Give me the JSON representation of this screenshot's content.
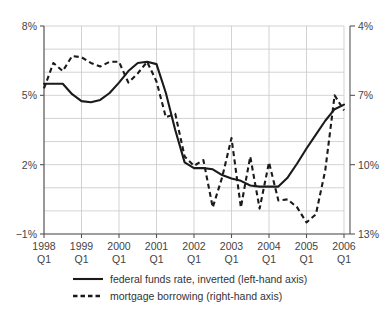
{
  "chart_data": {
    "type": "line",
    "title": "",
    "subtitle": "",
    "xlabel": "",
    "ylabel": "",
    "grid": true,
    "legend_position": "bottom",
    "x_tick_labels": [
      {
        "year": "1998",
        "quarter": "Q1"
      },
      {
        "year": "1999",
        "quarter": "Q1"
      },
      {
        "year": "2000",
        "quarter": "Q1"
      },
      {
        "year": "2001",
        "quarter": "Q1"
      },
      {
        "year": "2002",
        "quarter": "Q1"
      },
      {
        "year": "2003",
        "quarter": "Q1"
      },
      {
        "year": "2004",
        "quarter": "Q1"
      },
      {
        "year": "2005",
        "quarter": "Q1"
      },
      {
        "year": "2006",
        "quarter": "Q1"
      }
    ],
    "left_axis": {
      "name": "federal funds rate, inverted (left-hand axis)",
      "tick_labels": [
        "−1%",
        "2%",
        "5%",
        "8%"
      ],
      "tick_values": [
        -1,
        2,
        5,
        8
      ],
      "ylim": [
        8,
        -1
      ],
      "inverted": true
    },
    "right_axis": {
      "name": "mortgage borrowing (right-hand axis)",
      "tick_labels": [
        "13%",
        "10%",
        "7%",
        "4%"
      ],
      "tick_values": [
        13,
        10,
        7,
        4
      ],
      "ylim": [
        4,
        13
      ],
      "inverted": false
    },
    "x": [
      1998.0,
      1998.25,
      1998.5,
      1998.75,
      1999.0,
      1999.25,
      1999.5,
      1999.75,
      2000.0,
      2000.25,
      2000.5,
      2000.75,
      2001.0,
      2001.25,
      2001.5,
      2001.75,
      2002.0,
      2002.25,
      2002.5,
      2002.75,
      2003.0,
      2003.25,
      2003.5,
      2003.75,
      2004.0,
      2004.25,
      2004.5,
      2004.75,
      2005.0,
      2005.25,
      2005.5,
      2005.75,
      2006.0
    ],
    "series": [
      {
        "name": "federal funds rate, inverted (left-hand axis)",
        "axis": "left",
        "style": "solid",
        "values": [
          5.5,
          5.5,
          5.5,
          5.05,
          4.75,
          4.7,
          4.8,
          5.1,
          5.55,
          6.05,
          6.4,
          6.45,
          6.35,
          5.1,
          3.5,
          2.1,
          1.85,
          1.85,
          1.8,
          1.55,
          1.4,
          1.3,
          1.1,
          1.05,
          1.05,
          1.05,
          1.45,
          2.05,
          2.7,
          3.3,
          3.9,
          4.4,
          4.6
        ]
      },
      {
        "name": "mortgage borrowing (right-hand axis)",
        "axis": "right",
        "style": "dashed",
        "values": [
          6.7,
          5.6,
          5.95,
          5.3,
          5.35,
          5.6,
          5.75,
          5.55,
          5.55,
          6.45,
          6.05,
          5.55,
          6.4,
          7.95,
          7.8,
          9.65,
          10.05,
          9.8,
          11.85,
          10.55,
          8.85,
          11.85,
          9.65,
          11.9,
          9.9,
          11.55,
          11.5,
          11.85,
          12.5,
          12.15,
          10.25,
          7.0,
          7.65
        ]
      }
    ]
  },
  "legend": {
    "entries": [
      {
        "label": "federal funds rate, inverted (left-hand axis)",
        "style": "solid"
      },
      {
        "label": "mortgage borrowing (right-hand axis)",
        "style": "dashed"
      }
    ]
  }
}
